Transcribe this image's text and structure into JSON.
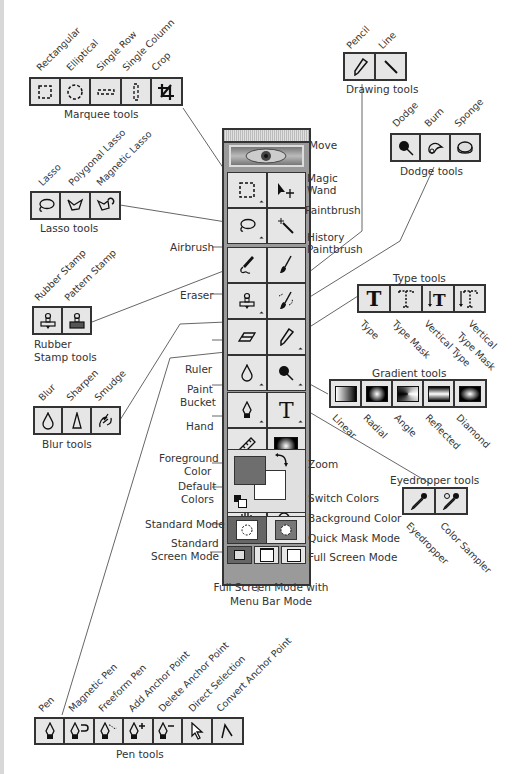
{
  "title_fragment": "...photo typesetting...",
  "groups": {
    "marquee": {
      "label": "Marquee tools",
      "tools": [
        "Rectangular",
        "Elliptical",
        "Single Row",
        "Single Column",
        "Crop"
      ]
    },
    "drawing": {
      "label": "Drawing tools",
      "tools": [
        "Pencil",
        "Line"
      ]
    },
    "dodge": {
      "label": "Dodge tools",
      "tools": [
        "Dodge",
        "Burn",
        "Sponge"
      ]
    },
    "lasso": {
      "label": "Lasso tools",
      "tools": [
        "Lasso",
        "Polygonal Lasso",
        "Magnetic Lasso"
      ]
    },
    "stamp": {
      "label_line1": "Rubber",
      "label_line2": "Stamp tools",
      "tools": [
        "Rubber Stamp",
        "Pattern Stamp"
      ]
    },
    "type": {
      "label": "Type tools",
      "tools": [
        "Type",
        "Type Mask",
        "Vertical Type",
        "Vertical",
        "Type Mask"
      ]
    },
    "gradient": {
      "label": "Gradient tools",
      "tools": [
        "Linear",
        "Radial",
        "Angle",
        "Reflected",
        "Diamond"
      ]
    },
    "blur": {
      "label": "Blur tools",
      "tools": [
        "Blur",
        "Sharpen",
        "Smudge"
      ]
    },
    "eyedropper": {
      "label": "Eyedropper tools",
      "tools": [
        "Eyedropper",
        "Color Sampler"
      ]
    },
    "pen": {
      "label": "Pen tools",
      "tools": [
        "Pen",
        "Magnetic Pen",
        "Freeform Pen",
        "Add Anchor Point",
        "Delete Anchor Point",
        "Direct Selection",
        "Convert Anchor Point"
      ]
    }
  },
  "toolbox_callouts": {
    "move": "Move",
    "magic_wand_1": "Magic",
    "magic_wand_2": "Wand",
    "paintbrush": "Paintbrush",
    "history_1": "History",
    "history_2": "Paintbrush",
    "airbrush": "Airbrush",
    "eraser": "Eraser",
    "ruler": "Ruler",
    "paint_bucket_1": "Paint",
    "paint_bucket_2": "Bucket",
    "hand": "Hand",
    "zoom": "Zoom",
    "foreground_1": "Foreground",
    "foreground_2": "Color",
    "default_1": "Default",
    "default_2": "Colors",
    "switch_colors": "Switch Colors",
    "background_color": "Background Color",
    "standard_mode": "Standard Mode",
    "quick_mask_mode": "Quick Mask Mode",
    "standard_screen_1": "Standard",
    "standard_screen_2": "Screen Mode",
    "full_screen": "Full Screen Mode",
    "full_screen_menu_1": "Full Screen Mode with",
    "full_screen_menu_2": "Menu Bar Mode"
  },
  "colors": {
    "foreground": "#6e6e6e",
    "background": "#ffffff",
    "button_face": "#e6e6e6",
    "toolbox_frame": "#9a9a9a",
    "outline": "#333333"
  }
}
